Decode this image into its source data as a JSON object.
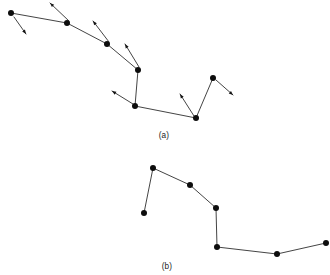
{
  "figure": {
    "background_color": "#ffffff",
    "ink_color": "#141414",
    "width": 330,
    "height": 275,
    "panels": [
      {
        "id": "panel-a",
        "caption": "(a)",
        "caption_x": 164,
        "caption_y": 138,
        "has_arrows": true
      },
      {
        "id": "panel-b",
        "caption": "(b)",
        "caption_x": 167,
        "caption_y": 269,
        "has_arrows": false
      }
    ]
  },
  "chart_data": [
    {
      "type": "line",
      "id": "panel-a-track",
      "title": "(a)",
      "xlabel": "",
      "ylabel": "",
      "grid": false,
      "legend": "none",
      "marker": "filled-circle",
      "marker_size": 3.0,
      "xlim": [
        0,
        330
      ],
      "ylim": [
        0,
        140
      ],
      "note": "Pixel coordinates; y increases downward as drawn.",
      "points": [
        {
          "x": 11,
          "y": 13
        },
        {
          "x": 67,
          "y": 23
        },
        {
          "x": 107,
          "y": 44
        },
        {
          "x": 138,
          "y": 70
        },
        {
          "x": 135,
          "y": 106
        },
        {
          "x": 196,
          "y": 118
        },
        {
          "x": 213,
          "y": 78
        }
      ],
      "x": [
        11,
        67,
        107,
        138,
        135,
        196,
        213
      ],
      "y": [
        13,
        23,
        44,
        70,
        106,
        118,
        78
      ],
      "vectors": [
        {
          "name": "arrow-1",
          "x1": 14,
          "y1": 17,
          "x2": 26,
          "y2": 34
        },
        {
          "name": "arrow-2",
          "x1": 69,
          "y1": 21,
          "x2": 50,
          "y2": 3
        },
        {
          "name": "arrow-3",
          "x1": 109,
          "y1": 42,
          "x2": 93,
          "y2": 21
        },
        {
          "name": "arrow-4",
          "x1": 139,
          "y1": 67,
          "x2": 125,
          "y2": 44
        },
        {
          "name": "arrow-5",
          "x1": 133,
          "y1": 104,
          "x2": 112,
          "y2": 91
        },
        {
          "name": "arrow-6",
          "x1": 194,
          "y1": 116,
          "x2": 180,
          "y2": 94
        },
        {
          "name": "arrow-7",
          "x1": 216,
          "y1": 80,
          "x2": 233,
          "y2": 95
        }
      ]
    },
    {
      "type": "line",
      "id": "panel-b-track",
      "title": "(b)",
      "xlabel": "",
      "ylabel": "",
      "grid": false,
      "legend": "none",
      "marker": "filled-circle",
      "marker_size": 3.0,
      "xlim": [
        0,
        330
      ],
      "ylim": [
        150,
        275
      ],
      "note": "Pixel coordinates; y increases downward as drawn.",
      "points": [
        {
          "x": 144,
          "y": 213
        },
        {
          "x": 153,
          "y": 168
        },
        {
          "x": 190,
          "y": 185
        },
        {
          "x": 216,
          "y": 208
        },
        {
          "x": 217,
          "y": 247
        },
        {
          "x": 277,
          "y": 254
        },
        {
          "x": 326,
          "y": 243
        }
      ],
      "x": [
        144,
        153,
        190,
        216,
        217,
        277,
        326
      ],
      "y": [
        213,
        168,
        185,
        208,
        247,
        254,
        243
      ],
      "vectors": []
    }
  ]
}
